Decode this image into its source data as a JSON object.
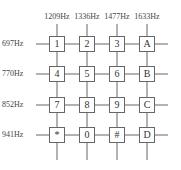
{
  "columns": [
    "1209Hz",
    "1336Hz",
    "1477Hz",
    "1633Hz"
  ],
  "rows": [
    "697Hz",
    "770Hz",
    "852Hz",
    "941Hz"
  ],
  "keys": [
    [
      "1",
      "2",
      "3",
      "A"
    ],
    [
      "4",
      "5",
      "6",
      "B"
    ],
    [
      "7",
      "8",
      "9",
      "C"
    ],
    [
      "*",
      "0",
      "#",
      "D"
    ]
  ],
  "colors": {
    "line": "#666666",
    "text": "#333333",
    "background": "#ffffff"
  }
}
